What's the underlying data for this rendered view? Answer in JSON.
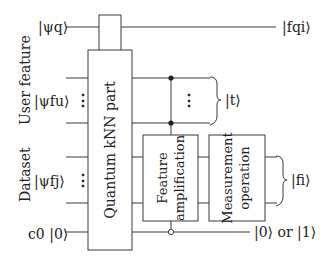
{
  "diagram": {
    "type": "quantum-circuit",
    "inputs": {
      "query": "|ψq⟩",
      "user_feature": "|ψfu⟩",
      "dataset": "|ψfj⟩",
      "ancilla": "c0 |0⟩"
    },
    "group_labels": {
      "user_feature": "User feature",
      "dataset": "Dataset"
    },
    "blocks": {
      "knn": "Quantum kNN part",
      "feature_amp_line1": "Feature",
      "feature_amp_line2": "amplification",
      "measure_line1": "Measurement",
      "measure_line2": "operation"
    },
    "outputs": {
      "query": "|fqi⟩",
      "t": "|t⟩",
      "fi": "|fi⟩",
      "ancilla": "|0⟩ or |1⟩"
    },
    "ellipsis": "⋮",
    "colors": {
      "line": "#3a3a3a",
      "text": "#222222",
      "background": "#ffffff"
    }
  }
}
